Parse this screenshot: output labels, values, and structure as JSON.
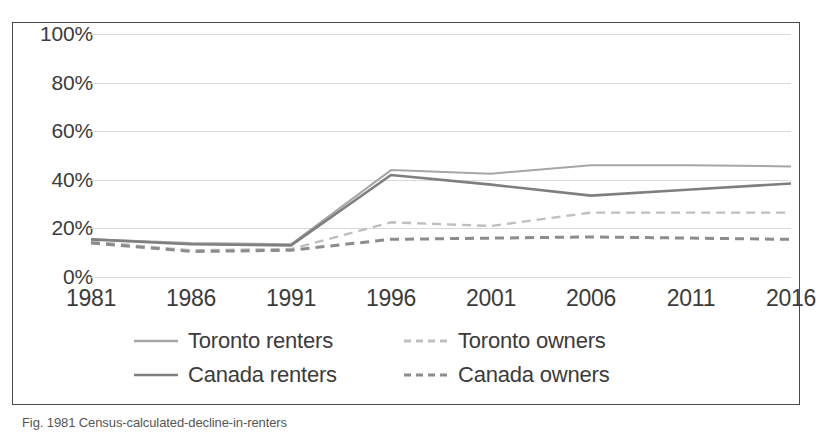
{
  "chart_data": {
    "type": "line",
    "title": "",
    "xlabel": "",
    "ylabel": "",
    "categories": [
      "1981",
      "1986",
      "1991",
      "1996",
      "2001",
      "2006",
      "2011",
      "2016"
    ],
    "x": [
      1981,
      1986,
      1991,
      1996,
      2001,
      2006,
      2011,
      2016
    ],
    "ylim": [
      0,
      100
    ],
    "yticks": [
      "0%",
      "20%",
      "40%",
      "60%",
      "80%",
      "100%"
    ],
    "ytick_values": [
      0,
      20,
      40,
      60,
      80,
      100
    ],
    "grid": true,
    "legend_position": "bottom",
    "series": [
      {
        "name": "Toronto renters",
        "style": "solid",
        "color": "#a6a6a6",
        "width": 2.0,
        "values": [
          15.5,
          14.0,
          13.5,
          44.0,
          42.5,
          46.0,
          46.0,
          45.5
        ]
      },
      {
        "name": "Toronto owners",
        "style": "dashed",
        "color": "#bfbfbf",
        "width": 2.4,
        "values": [
          14.5,
          11.0,
          11.5,
          22.5,
          21.0,
          26.5,
          26.5,
          26.5
        ]
      },
      {
        "name": "Canada renters",
        "style": "solid",
        "color": "#7f7f7f",
        "width": 2.6,
        "values": [
          15.5,
          13.5,
          13.0,
          42.0,
          38.0,
          33.5,
          36.0,
          38.5
        ]
      },
      {
        "name": "Canada owners",
        "style": "dashed",
        "color": "#8c8c8c",
        "width": 3.0,
        "values": [
          14.0,
          10.5,
          11.0,
          15.5,
          16.0,
          16.5,
          16.0,
          15.5
        ]
      }
    ]
  },
  "legend": {
    "items": [
      {
        "label": "Toronto renters",
        "color": "#a6a6a6",
        "style": "solid",
        "name": "legend-toronto-renters"
      },
      {
        "label": "Toronto owners",
        "color": "#bfbfbf",
        "style": "dashed",
        "name": "legend-toronto-owners"
      },
      {
        "label": "Canada renters",
        "color": "#7f7f7f",
        "style": "solid",
        "name": "legend-canada-renters"
      },
      {
        "label": "Canada owners",
        "color": "#8c8c8c",
        "style": "dashed",
        "name": "legend-canada-owners"
      }
    ]
  },
  "caption": {
    "text": "Fig. 1981 Census-calculated-decline-in-renters"
  },
  "colors": {
    "border": "#4a4a4a",
    "gridline": "#d9d9d9",
    "text": "#3b3b3b",
    "background": "#ffffff"
  }
}
